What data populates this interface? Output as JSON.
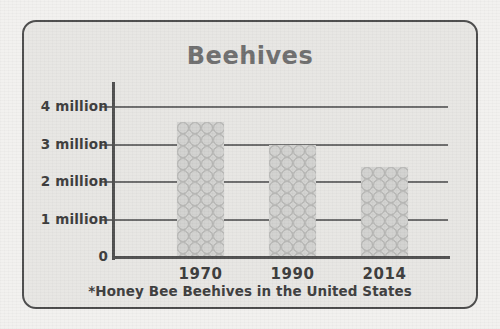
{
  "chart_data": {
    "type": "bar",
    "title": "Beehives",
    "footnote": "*Honey Bee Beehives in the United States",
    "categories": [
      "1970",
      "1990",
      "2014"
    ],
    "values": [
      3.6,
      3.0,
      2.4
    ],
    "unit": "million",
    "xlabel": "",
    "ylabel": "",
    "ylim": [
      0,
      4.6
    ],
    "grid": true,
    "legend": false,
    "y_ticks": [
      {
        "value": 4,
        "label": "4 million"
      },
      {
        "value": 3,
        "label": "3 million"
      },
      {
        "value": 2,
        "label": "2 million"
      },
      {
        "value": 1,
        "label": "1 million"
      },
      {
        "value": 0,
        "label": "0"
      }
    ],
    "series": [
      {
        "name": "Honey Bee Beehives",
        "points": [
          {
            "category": "1970",
            "value": 3.6,
            "label": "3.6 million"
          },
          {
            "category": "1990",
            "value": 3.0,
            "label": "3 million"
          },
          {
            "category": "2014",
            "value": 2.4,
            "label": "2.4 million"
          }
        ]
      }
    ]
  },
  "style": {
    "page_background": "#f2f1ef",
    "card_background": "#e7e6e3",
    "card_border": "#4a4a4a",
    "title_color": "#6e6e6e",
    "text_color": "#3a3a3a",
    "axis_color": "#4f4f4f",
    "gridline_color": "#6d6d6d",
    "bar_fill": "#c4c4c2",
    "bar_cell": "#d2d2d0",
    "bar_cell_edge": "#b9b9b7"
  }
}
